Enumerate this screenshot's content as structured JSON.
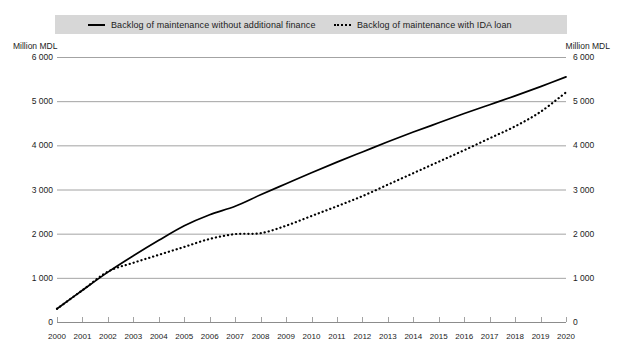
{
  "legend": {
    "items": [
      {
        "label": "Backlog of maintenance without additional finance",
        "style": "solid",
        "swatch_name": "legend-swatch-solid"
      },
      {
        "label": "Backlog of maintenance with IDA loan",
        "style": "dotted",
        "swatch_name": "legend-swatch-dotted"
      }
    ]
  },
  "axis_captions": {
    "left": "Million MDL",
    "right": "Million MDL"
  },
  "colors": {
    "line": "#000000",
    "grid": "#8c8c8c",
    "legend_band": "#d7d7d7",
    "text": "#1c1c1c"
  },
  "chart_data": {
    "type": "line",
    "title": "",
    "subtitle": "",
    "xlabel": "",
    "ylabel": "Million MDL",
    "ylabel_right": "Million MDL",
    "ylim": [
      0,
      6000
    ],
    "yticks": [
      0,
      1000,
      2000,
      3000,
      4000,
      5000,
      6000
    ],
    "ytick_labels": [
      "0",
      "1 000",
      "2 000",
      "3 000",
      "4 000",
      "5 000",
      "6 000"
    ],
    "grid": true,
    "legend_position": "top",
    "x": [
      2000,
      2001,
      2002,
      2003,
      2004,
      2005,
      2006,
      2007,
      2008,
      2009,
      2010,
      2011,
      2012,
      2013,
      2014,
      2015,
      2016,
      2017,
      2018,
      2019,
      2020
    ],
    "xtick_labels": [
      "2000",
      "2001",
      "2002",
      "2003",
      "2004",
      "2005",
      "2006",
      "2007",
      "2008",
      "2009",
      "2010",
      "2011",
      "2012",
      "2013",
      "2014",
      "2015",
      "2016",
      "2017",
      "2018",
      "2019",
      "2020"
    ],
    "series": [
      {
        "name": "Backlog of maintenance without additional finance",
        "style": "solid",
        "values": [
          300,
          720,
          1130,
          1500,
          1850,
          2180,
          2430,
          2620,
          2880,
          3130,
          3380,
          3620,
          3850,
          4080,
          4300,
          4510,
          4720,
          4920,
          5120,
          5330,
          5550
        ]
      },
      {
        "name": "Backlog of maintenance with IDA loan",
        "style": "dotted",
        "values": [
          300,
          720,
          1140,
          1340,
          1520,
          1700,
          1880,
          1990,
          2010,
          2180,
          2400,
          2620,
          2850,
          3110,
          3370,
          3630,
          3890,
          4160,
          4430,
          4760,
          5200
        ]
      }
    ]
  }
}
